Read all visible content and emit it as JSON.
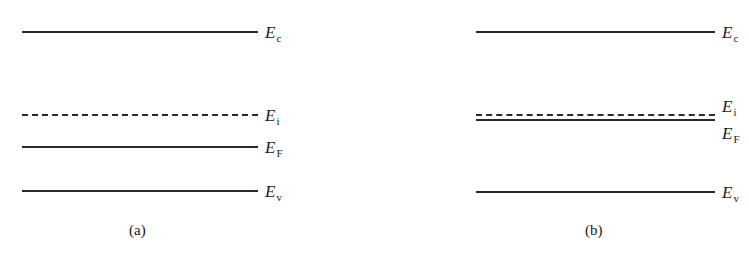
{
  "figure": {
    "panels": [
      {
        "id": "a",
        "caption": "(a)",
        "levels": [
          {
            "name": "E",
            "sub": "c",
            "style": "solid"
          },
          {
            "name": "E",
            "sub": "i",
            "style": "dashed"
          },
          {
            "name": "E",
            "sub": "F",
            "style": "solid"
          },
          {
            "name": "E",
            "sub": "v",
            "style": "solid"
          }
        ]
      },
      {
        "id": "b",
        "caption": "(b)",
        "levels": [
          {
            "name": "E",
            "sub": "c",
            "style": "solid"
          },
          {
            "name": "E",
            "sub": "i",
            "style": "dashed"
          },
          {
            "name": "E",
            "sub": "F",
            "style": "solid"
          },
          {
            "name": "E",
            "sub": "v",
            "style": "solid"
          }
        ]
      }
    ]
  }
}
